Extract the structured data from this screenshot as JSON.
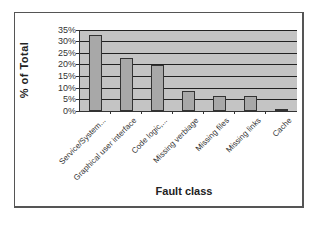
{
  "chart_data": {
    "type": "bar",
    "title": "",
    "xlabel": "Fault class",
    "ylabel": "% of Total",
    "categories": [
      "Service/System...",
      "Graphical user interface",
      "Code logic,...",
      "Missing verbiage",
      "Missing files",
      "Missing links",
      "Cache"
    ],
    "values": [
      33,
      23,
      20,
      8.5,
      6.5,
      6.5,
      1
    ],
    "unit": "%",
    "ylim": [
      0,
      35
    ],
    "yticks": [
      "0%",
      "5%",
      "10%",
      "15%",
      "20%",
      "25%",
      "30%",
      "35%"
    ],
    "grid": true,
    "legend": null,
    "colors": {
      "plot_background": "#c4c4c4",
      "bar_fill": "#a8a8a8",
      "bar_border": "#333333",
      "gridline": "#222222"
    }
  },
  "axes": {
    "y_title": "% of Total",
    "x_title": "Fault class",
    "y_ticks": [
      "35%",
      "30%",
      "25%",
      "20%",
      "15%",
      "10%",
      "5%",
      "0%"
    ]
  },
  "categories": [
    "Service/System...",
    "Graphical user interface",
    "Code logic,...",
    "Missing verbiage",
    "Missing files",
    "Missing links",
    "Cache"
  ]
}
